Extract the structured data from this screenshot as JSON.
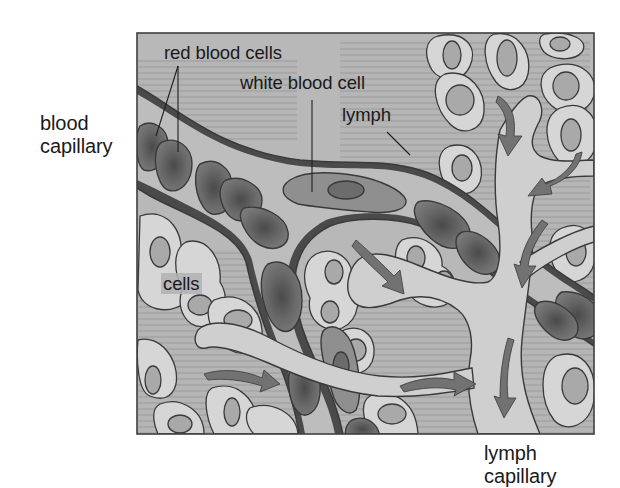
{
  "diagram": {
    "style": "grayscale textbook illustration",
    "colors": {
      "background": "#ffffff",
      "tissue_fluid": "#b4b4b4",
      "tissue_stripes": "#a6a6a6",
      "blood_plasma": "#bdbdbd",
      "capillary_wall": "#4a4a4a",
      "red_blood_cell": "#6e6e6e",
      "red_blood_cell_core": "#4f4f4f",
      "white_blood_cell": "#8f8f8f",
      "white_blood_cell_nucleus": "#6c6c6c",
      "tissue_cell": "#d6d6d6",
      "tissue_cell_nucleus": "#a9a9a9",
      "lymph_vessel": "#cfcfcf",
      "arrow": "#727272",
      "outline": "#3a3a3a",
      "text": "#1a1a1a"
    },
    "labels": {
      "blood_capillary": [
        "blood",
        "capillary"
      ],
      "red_blood_cells": "red blood cells",
      "white_blood_cell": "white blood cell",
      "lymph": "lymph",
      "cells": "cells",
      "lymph_capillary": [
        "lymph",
        "capillary"
      ]
    },
    "arrows": {
      "count": 8,
      "meaning": "direction of fluid flow from tissue into lymph capillary"
    }
  }
}
